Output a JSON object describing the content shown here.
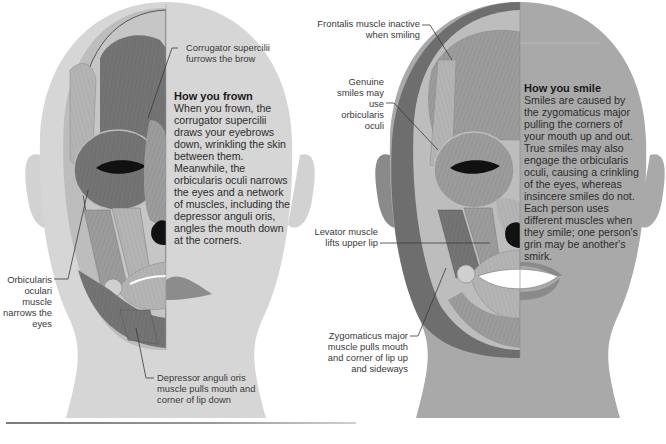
{
  "colors": {
    "skin_light": "#d6d6d6",
    "skin_dark_right": "#a9a9a9",
    "muscle_dark": "#6f6f6f",
    "muscle_mid": "#9a9a9a",
    "muscle_light": "#bcbcbc",
    "text": "#2c2c2c",
    "leader_line": "#3a3a3a"
  },
  "frown_panel": {
    "heading": "How you frown",
    "body": "When you frown, the corrugator supercilii draws your eyebrows down, wrinkling the skin between them. Meanwhile, the orbicularis oculi narrows the eyes and a network of muscles, including the depressor anguli oris, angles the mouth down at the corners.",
    "labels": {
      "corrugator": "Corrugator supercilii furrows the brow",
      "orbicularis": "Orbicularis oculari muscle narrows the eyes",
      "depressor": "Depressor anguli oris muscle pulls mouth and corner of lip down"
    }
  },
  "smile_panel": {
    "heading": "How you smile",
    "body": "Smiles are caused by the zygomaticus major pulling the corners of your mouth up and out. True smiles may also engage the orbicularis oculi, causing a crinkling of the eyes, whereas insincere smiles do not. Each person uses different muscles when they smile; one person's grin may be another's smirk.",
    "labels": {
      "frontalis": "Frontalis muscle inactive when smiling",
      "genuine": "Genuine smiles may use orbicularis oculi",
      "levator": "Levator muscle lifts upper lip",
      "zygomaticus": "Zygomaticus major muscle pulls mouth and corner of lip up and sideways"
    }
  }
}
